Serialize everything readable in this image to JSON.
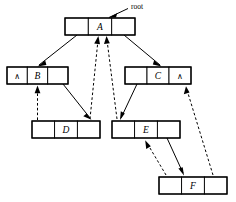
{
  "diagram": {
    "type": "node-link-diagram",
    "width": 236,
    "height": 202,
    "background_color": "#ffffff",
    "line_color": "#000000",
    "root_pointer": {
      "label": "root",
      "target_node": "A",
      "arrow_style": "solid"
    },
    "nil_symbol": "∧",
    "nodes": [
      {
        "id": "A",
        "label": "A",
        "x": 65,
        "y": 18,
        "width": 70,
        "height": 17,
        "cells": [
          {
            "index": 0,
            "content": "",
            "role": "left-pointer"
          },
          {
            "index": 1,
            "content": "A",
            "role": "data"
          },
          {
            "index": 2,
            "content": "",
            "role": "right-pointer"
          }
        ]
      },
      {
        "id": "B",
        "label": "B",
        "x": 7,
        "y": 67,
        "width": 61,
        "height": 17,
        "cells": [
          {
            "index": 0,
            "content": "∧",
            "role": "nil-pointer"
          },
          {
            "index": 1,
            "content": "B",
            "role": "data"
          },
          {
            "index": 2,
            "content": "",
            "role": "right-pointer"
          }
        ]
      },
      {
        "id": "C",
        "label": "C",
        "x": 125,
        "y": 67,
        "width": 66,
        "height": 17,
        "cells": [
          {
            "index": 0,
            "content": "",
            "role": "left-pointer"
          },
          {
            "index": 1,
            "content": "C",
            "role": "data"
          },
          {
            "index": 2,
            "content": "∧",
            "role": "nil-pointer"
          }
        ]
      },
      {
        "id": "D",
        "label": "D",
        "x": 32,
        "y": 121,
        "width": 68,
        "height": 17,
        "cells": [
          {
            "index": 0,
            "content": "",
            "role": "left-pointer"
          },
          {
            "index": 1,
            "content": "D",
            "role": "data"
          },
          {
            "index": 2,
            "content": "",
            "role": "right-pointer"
          }
        ]
      },
      {
        "id": "E",
        "label": "E",
        "x": 112,
        "y": 121,
        "width": 68,
        "height": 17,
        "cells": [
          {
            "index": 0,
            "content": "",
            "role": "left-pointer"
          },
          {
            "index": 1,
            "content": "E",
            "role": "data"
          },
          {
            "index": 2,
            "content": "",
            "role": "right-pointer"
          }
        ]
      },
      {
        "id": "F",
        "label": "F",
        "x": 159,
        "y": 177,
        "width": 68,
        "height": 17,
        "cells": [
          {
            "index": 0,
            "content": "",
            "role": "left-pointer"
          },
          {
            "index": 1,
            "content": "F",
            "role": "data"
          },
          {
            "index": 2,
            "content": "",
            "role": "right-pointer"
          }
        ]
      }
    ],
    "edges": [
      {
        "from": "A",
        "to": "B",
        "style": "solid",
        "direction": "down-left"
      },
      {
        "from": "A",
        "to": "C",
        "style": "solid",
        "direction": "down-right"
      },
      {
        "from": "B",
        "to": "D",
        "style": "solid",
        "direction": "down-right"
      },
      {
        "from": "C",
        "to": "E",
        "style": "solid",
        "direction": "down-left"
      },
      {
        "from": "E",
        "to": "F",
        "style": "solid",
        "direction": "down-right"
      },
      {
        "from": "D",
        "to": "B",
        "style": "dashed",
        "direction": "up"
      },
      {
        "from": "D",
        "to": "A",
        "style": "dashed",
        "direction": "up-right"
      },
      {
        "from": "E",
        "to": "A",
        "style": "dashed",
        "direction": "up-left"
      },
      {
        "from": "F",
        "to": "E",
        "style": "dashed",
        "direction": "up-left"
      },
      {
        "from": "F",
        "to": "C",
        "style": "dashed",
        "direction": "up-left"
      }
    ]
  }
}
